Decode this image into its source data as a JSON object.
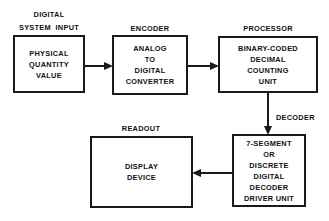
{
  "diagram": {
    "background_color": "#ffffff",
    "line_color": "#1a1a1a",
    "text_color": "#111111",
    "stages": [
      {
        "id": "digital-system-input",
        "caption": "DIGITAL\nSYSTEM  INPUT",
        "body": "PHYSICAL\nQUANTITY\nVALUE"
      },
      {
        "id": "encoder",
        "caption": "ENCODER",
        "body": "ANALOG\nTO\nDIGITAL\nCONVERTER"
      },
      {
        "id": "processor",
        "caption": "PROCESSOR",
        "body": "BINARY-CODED\nDECIMAL\nCOUNTING\nUNIT"
      },
      {
        "id": "decoder",
        "caption": "DECODER",
        "body": "7-SEGMENT\nOR\nDISCRETE\nDIGITAL\nDECODER\nDRIVER UNIT"
      },
      {
        "id": "readout",
        "caption": "READOUT",
        "body": "DISPLAY\nDEVICE"
      }
    ],
    "connectors": [
      {
        "id": "input-to-encoder",
        "direction": "right"
      },
      {
        "id": "encoder-to-processor",
        "direction": "right"
      },
      {
        "id": "processor-to-decoder",
        "direction": "down"
      },
      {
        "id": "decoder-to-readout",
        "direction": "left"
      }
    ]
  }
}
